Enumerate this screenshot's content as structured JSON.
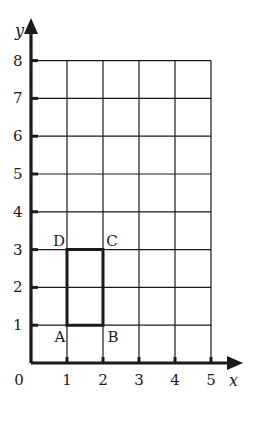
{
  "diagram": {
    "type": "coordinate-grid",
    "x_axis": {
      "label": "x",
      "ticks": [
        "0",
        "1",
        "2",
        "3",
        "4",
        "5"
      ],
      "min": 0,
      "max": 5
    },
    "y_axis": {
      "label": "y",
      "ticks": [
        "1",
        "2",
        "3",
        "4",
        "5",
        "6",
        "7",
        "8"
      ],
      "min": 0,
      "max": 8
    },
    "origin_label": "0",
    "rectangle": {
      "vertices": [
        {
          "name": "A",
          "x": 1,
          "y": 1
        },
        {
          "name": "B",
          "x": 2,
          "y": 1
        },
        {
          "name": "C",
          "x": 2,
          "y": 3
        },
        {
          "name": "D",
          "x": 1,
          "y": 3
        }
      ]
    },
    "colors": {
      "line": "#1a1a1a",
      "background": "#ffffff"
    }
  }
}
